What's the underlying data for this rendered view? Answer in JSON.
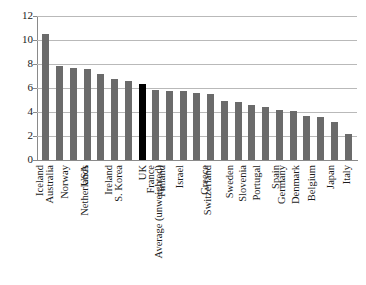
{
  "chart_data": {
    "type": "bar",
    "title": "",
    "subtitle": "",
    "xlabel": "",
    "ylabel": "",
    "ylim": [
      0,
      12
    ],
    "yticks": [
      0,
      2,
      4,
      6,
      8,
      10,
      12
    ],
    "grid": true,
    "legend": "none",
    "bar_color": "#6b6b6b",
    "highlight_color": "#000000",
    "highlight_category": "UK",
    "categories": [
      "Iceland",
      "Australia",
      "Norway",
      "USA",
      "Netherlands",
      "Ireland",
      "S. Korea",
      "UK",
      "France",
      "Finland",
      "Israel",
      "Average (unweighted)",
      "Greece",
      "Switzerland",
      "Sweden",
      "Slovenia",
      "Portugal",
      "Spain",
      "Germany",
      "Denmark",
      "Belgium",
      "Japan",
      "Italy"
    ],
    "values": [
      10.5,
      7.8,
      7.7,
      7.55,
      7.15,
      6.75,
      6.55,
      6.3,
      5.8,
      5.75,
      5.75,
      5.6,
      5.5,
      4.95,
      4.85,
      4.6,
      4.4,
      4.2,
      4.1,
      3.7,
      3.6,
      3.2,
      2.15
    ]
  }
}
